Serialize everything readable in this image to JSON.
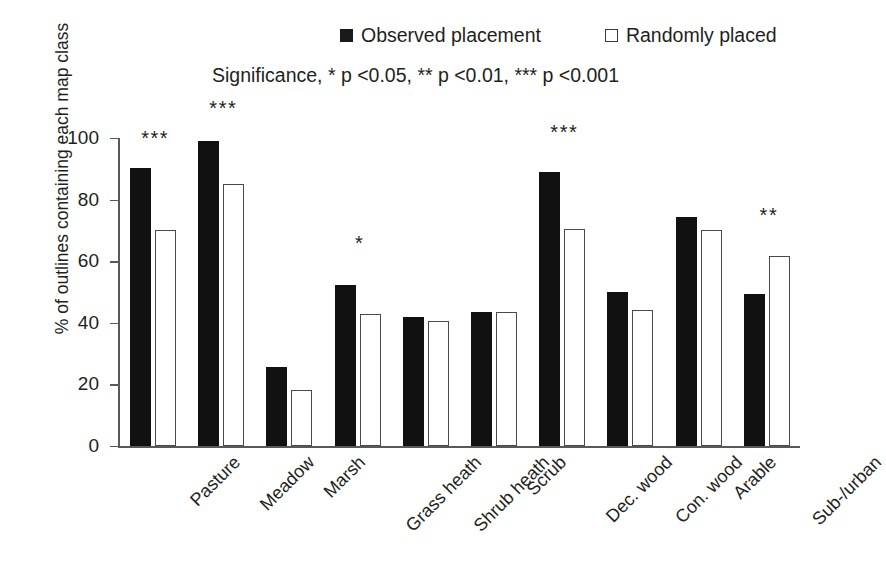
{
  "legend": {
    "entries": [
      {
        "label": "Observed placement",
        "style": "filled",
        "color": "#111111"
      },
      {
        "label": "Randomly placed",
        "style": "hollow",
        "color": "#ffffff"
      }
    ]
  },
  "caption": {
    "significance": "Significance, * p <0.05, ** p <0.01, *** p <0.001"
  },
  "axes": {
    "y_title": "% of outlines containing each map class",
    "y_ticks": [
      "0",
      "20",
      "40",
      "60",
      "80",
      "100"
    ]
  },
  "chart_data": {
    "type": "bar",
    "title": "",
    "subtitle": "Significance, * p <0.05, ** p <0.01, *** p <0.001",
    "xlabel": "",
    "ylabel": "% of outlines containing each map class",
    "ylim": [
      0,
      100
    ],
    "ytick_step": 20,
    "yticks": [
      0,
      20,
      40,
      60,
      80,
      100
    ],
    "grid": false,
    "legend_position": "top",
    "categories": [
      "Pasture",
      "Meadow",
      "Marsh",
      "Grass heath",
      "Shrub heath",
      "Scrub",
      "Dec. wood",
      "Con. wood",
      "Arable",
      "Sub-/urban"
    ],
    "series": [
      {
        "name": "Observed placement",
        "color": "#111111",
        "values": [
          90.4,
          99.0,
          25.5,
          52.3,
          42.0,
          43.5,
          89.0,
          50.0,
          74.5,
          49.5
        ]
      },
      {
        "name": "Randomly placed",
        "color": "#ffffff",
        "values": [
          70.2,
          85.0,
          18.3,
          43.0,
          40.5,
          43.5,
          70.5,
          44.3,
          70.2,
          61.8
        ]
      }
    ],
    "annotations": [
      {
        "category": "Pasture",
        "text": "***",
        "value": 96
      },
      {
        "category": "Meadow",
        "text": "***",
        "value": 106
      },
      {
        "category": "Marsh",
        "text": "",
        "value": 0
      },
      {
        "category": "Grass heath",
        "text": "*",
        "value": 62
      },
      {
        "category": "Shrub heath",
        "text": "",
        "value": 0
      },
      {
        "category": "Scrub",
        "text": "",
        "value": 0
      },
      {
        "category": "Dec. wood",
        "text": "***",
        "value": 98
      },
      {
        "category": "Con. wood",
        "text": "",
        "value": 0
      },
      {
        "category": "Arable",
        "text": "",
        "value": 0
      },
      {
        "category": "Sub-/urban",
        "text": "**",
        "value": 71
      }
    ]
  }
}
